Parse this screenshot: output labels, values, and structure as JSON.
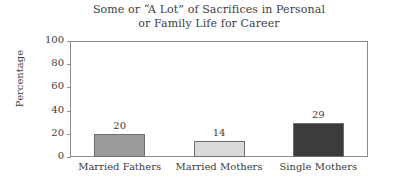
{
  "chart_data": {
    "type": "bar",
    "title": "Some or “A Lot” of Sacrifices in Personal or Family Life for Career",
    "title_lines": [
      "Some or “A Lot” of Sacrifices in Personal",
      "or Family Life for Career"
    ],
    "categories": [
      "Married Fathers",
      "Married Mothers",
      "Single Mothers"
    ],
    "values": [
      20,
      14,
      29
    ],
    "bar_colors": [
      "#9a9a9a",
      "#d9d9d9",
      "#3c3c3c"
    ],
    "xlabel": "",
    "ylabel": "Percentage",
    "ylim": [
      0,
      100
    ],
    "yticks": [
      0,
      20,
      40,
      60,
      80,
      100
    ],
    "ytick_labels": [
      "0",
      "20",
      "40",
      "60",
      "80",
      "100"
    ],
    "grid": false,
    "legend": false,
    "value_labels_shown": true,
    "frame_color": "#8c8c8c",
    "bar_edge_color": "#6d6d6d",
    "background": "#ffffff",
    "text_color": "#3d3d3d"
  }
}
